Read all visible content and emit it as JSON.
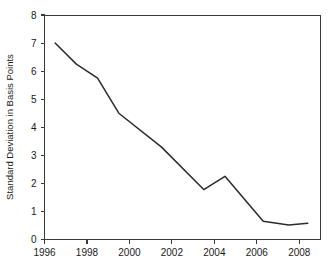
{
  "chart_data": {
    "type": "line",
    "title": "",
    "subtitle": "",
    "xlabel": "",
    "ylabel": "Standard Deviation in Basis Points",
    "xlim": [
      1996,
      2009
    ],
    "ylim": [
      0,
      8
    ],
    "grid": false,
    "legend": null,
    "legend_position": "none",
    "x_ticks": [
      1996,
      1998,
      2000,
      2002,
      2004,
      2006,
      2008
    ],
    "x_tick_labels": [
      "1996",
      "1998",
      "2000",
      "2002",
      "2004",
      "2006",
      "2008"
    ],
    "y_ticks": [
      0,
      1,
      2,
      3,
      4,
      5,
      6,
      7,
      8
    ],
    "y_tick_labels": [
      "0",
      "1",
      "2",
      "3",
      "4",
      "5",
      "6",
      "7",
      "8"
    ],
    "series": [
      {
        "name": "Standard Deviation",
        "color": "#2b2b2b",
        "x": [
          1996.5,
          1997.5,
          1998.5,
          1999.5,
          2001.5,
          2003.5,
          2004.5,
          2006.3,
          2007.5,
          2008.4
        ],
        "values": [
          7.0,
          6.25,
          5.75,
          4.5,
          3.3,
          1.78,
          2.25,
          0.65,
          0.52,
          0.58
        ]
      }
    ],
    "annotations": []
  },
  "axes": {
    "y_title": "Standard Deviation in Basis Points"
  },
  "colors": {
    "line": "#2b2b2b",
    "axis": "#3a3a3a",
    "background": "#ffffff",
    "text": "#1a1a1a"
  }
}
